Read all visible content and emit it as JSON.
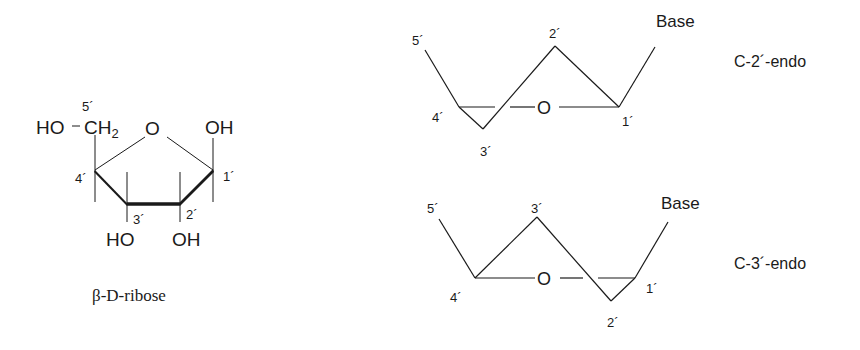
{
  "ribose": {
    "caption": "β-D-ribose",
    "ho_ch2_ho": "HO",
    "ch2": "CH",
    "ch2_sub": "2",
    "ring_o": "O",
    "oh_c1": "OH",
    "oh_c2": "OH",
    "ho_c3": "HO",
    "c1": "1´",
    "c2": "2´",
    "c3": "3´",
    "c4": "4´",
    "c5": "5´"
  },
  "c2_endo": {
    "title": "C-2´-endo",
    "base": "Base",
    "ring_o": "O",
    "c1": "1´",
    "c2": "2´",
    "c3": "3´",
    "c4": "4´",
    "c5": "5´"
  },
  "c3_endo": {
    "title": "C-3´-endo",
    "base": "Base",
    "ring_o": "O",
    "c1": "1´",
    "c2": "2´",
    "c3": "3´",
    "c4": "4´",
    "c5": "5´"
  },
  "colors": {
    "ink": "#1a1a1a",
    "background": "#ffffff"
  }
}
